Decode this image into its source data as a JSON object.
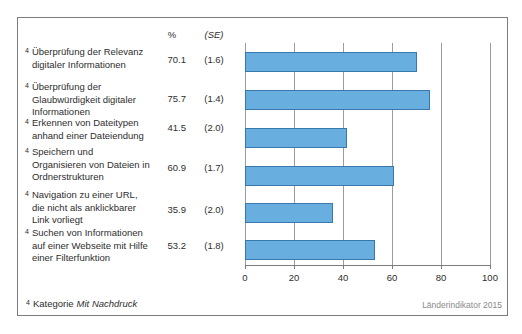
{
  "chart_data": {
    "type": "bar",
    "orientation": "horizontal",
    "categories": [
      "Überprüfung der Relevanz digitaler Informationen",
      "Überprüfung der Glaubwürdigkeit digitaler Informationen",
      "Erkennen von Dateitypen anhand einer Dateiendung",
      "Speichern und Organisieren von Dateien in Ordnerstrukturen",
      "Navigation zu einer URL, die nicht als anklickbarer Link vorliegt",
      "Suchen von Informationen auf einer Webseite mit Hilfe einer Filterfunktion"
    ],
    "values": [
      70.1,
      75.7,
      41.5,
      60.9,
      35.9,
      53.2
    ],
    "standard_errors": [
      1.6,
      1.4,
      2.0,
      1.7,
      2.0,
      1.8
    ],
    "xlim": [
      0,
      100
    ],
    "x_ticks": [
      0,
      20,
      40,
      60,
      80,
      100
    ],
    "grid": true,
    "legend": "none",
    "bar_color": "#68aedf",
    "bar_border_color": "#3878ae",
    "footnote": "4 Kategorie Mit Nachdruck",
    "source": "Länderindikator 2015"
  },
  "table": {
    "percent_header": "%",
    "se_header": "(SE)"
  },
  "rows": [
    {
      "superscript": "4",
      "label": "Überprüfung der Relevanz\ndigitaler Informationen",
      "percent": "70.1",
      "se": "(1.6)"
    },
    {
      "superscript": "4",
      "label": "Überprüfung der\nGlaubwürdigkeit digitaler\nInformationen",
      "percent": "75.7",
      "se": "(1.4)"
    },
    {
      "superscript": "4",
      "label": "Erkennen von Dateitypen\nanhand einer Dateiendung",
      "percent": "41.5",
      "se": "(2.0)"
    },
    {
      "superscript": "4",
      "label": "Speichern und\nOrganisieren von Dateien in\nOrdnerstrukturen",
      "percent": "60.9",
      "se": "(1.7)"
    },
    {
      "superscript": "4",
      "label": "Navigation zu einer URL,\ndie nicht als anklickbarer\nLink vorliegt",
      "percent": "35.9",
      "se": "(2.0)"
    },
    {
      "superscript": "4",
      "label": "Suchen von Informationen\nauf einer Webseite mit Hilfe\neiner Filterfunktion",
      "percent": "53.2",
      "se": "(1.8)"
    }
  ],
  "footnote": {
    "superscript": "4",
    "text": "Kategorie",
    "emphasis": "Mit Nachdruck"
  },
  "source": "Länderindikator 2015"
}
